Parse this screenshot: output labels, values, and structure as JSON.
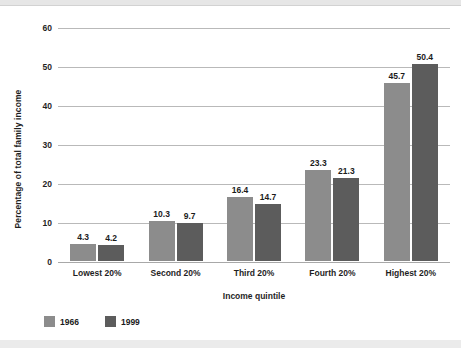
{
  "chart_data": {
    "type": "bar",
    "title": "",
    "subtitle": "",
    "xlabel": "Income quintile",
    "ylabel": "Percentage of total family income",
    "categories": [
      "Lowest 20%",
      "Second 20%",
      "Third 20%",
      "Fourth 20%",
      "Highest 20%"
    ],
    "series": [
      {
        "name": "1966",
        "color": "#8c8c8c",
        "values": [
          4.3,
          10.3,
          16.4,
          23.3,
          45.7
        ]
      },
      {
        "name": "1999",
        "color": "#5c5c5c",
        "values": [
          4.2,
          9.7,
          14.7,
          21.3,
          50.4
        ]
      }
    ],
    "value_labels": [
      [
        "4.3",
        "4.2"
      ],
      [
        "10.3",
        "9.7"
      ],
      [
        "16.4",
        "14.7"
      ],
      [
        "23.3",
        "21.3"
      ],
      [
        "45.7",
        "50.4"
      ]
    ],
    "ylim": [
      0,
      60
    ],
    "ytick_values": [
      0,
      10,
      20,
      30,
      40,
      50,
      60
    ],
    "ytick_labels": [
      "0",
      "10",
      "20",
      "30",
      "40",
      "50",
      "60"
    ],
    "grid": true,
    "grid_axis": "y",
    "legend_position": "bottom-left",
    "legend": [
      "1966",
      "1999"
    ]
  },
  "legend": {
    "items": [
      {
        "label": "1966",
        "color": "#8c8c8c"
      },
      {
        "label": "1999",
        "color": "#5c5c5c"
      }
    ]
  }
}
